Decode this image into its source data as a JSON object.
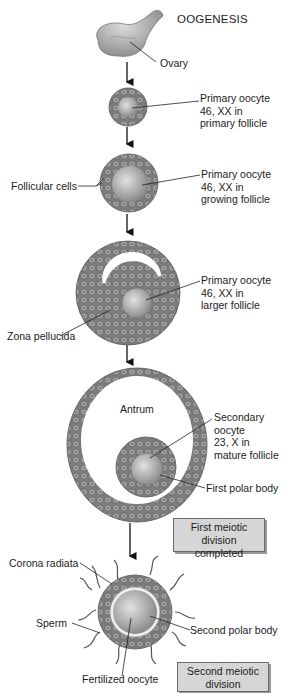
{
  "diagram": {
    "title": "OOGENESIS",
    "stages": [
      {
        "id": "ovary",
        "label": "Ovary"
      },
      {
        "id": "primary-follicle",
        "label_lines": [
          "Primary oocyte",
          "46, XX in",
          "primary follicle"
        ]
      },
      {
        "id": "growing-follicle",
        "label_lines": [
          "Primary oocyte",
          "46, XX in",
          "growing follicle"
        ],
        "side_label": "Follicular cells"
      },
      {
        "id": "larger-follicle",
        "label_lines": [
          "Primary oocyte",
          "46, XX in",
          "larger follicle"
        ],
        "side_label": "Zona pellucida"
      },
      {
        "id": "mature-follicle",
        "label_lines": [
          "Secondary",
          "oocyte",
          "23, X in",
          "mature follicle"
        ],
        "inner_label": "Antrum",
        "polar_label": "First polar body"
      },
      {
        "id": "fertilized",
        "labels": {
          "corona": "Corona radiata",
          "sperm": "Sperm",
          "polar": "Second polar body",
          "oocyte": "Fertilized oocyte"
        }
      }
    ],
    "boxes": {
      "first": [
        "First meiotic",
        "division completed"
      ],
      "second": [
        "Second meiotic",
        "division completed"
      ]
    },
    "colors": {
      "cell_fill": "#8f8f8f",
      "cell_stroke": "#5a5a5a",
      "oocyte_fill": "#b5b5b5",
      "box_fill": "#d6d6d6",
      "line": "#222222"
    }
  }
}
